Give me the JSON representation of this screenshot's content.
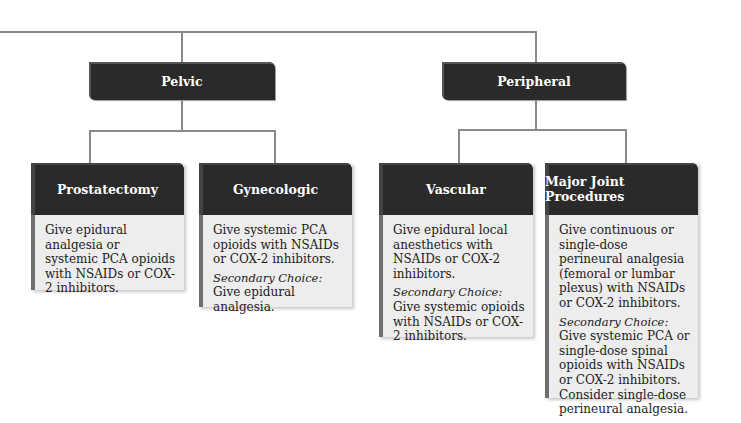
{
  "categories": [
    {
      "label": "Pelvic"
    },
    {
      "label": "Peripheral"
    }
  ],
  "procedures": [
    {
      "title": "Prostatectomy",
      "text": "Give epidural analgesia or systemic PCA opioids with NSAIDs or COX-2 inhibitors.",
      "secondary_label": "",
      "secondary_text": ""
    },
    {
      "title": "Gynecologic",
      "text": "Give systemic PCA opioids with NSAIDs or COX-2 inhibitors.",
      "secondary_label": "Secondary Choice:",
      "secondary_text": "Give epidural analgesia."
    },
    {
      "title": "Vascular",
      "text": "Give epidural local anesthetics with NSAIDs or COX-2 inhibitors.",
      "secondary_label": "Secondary Choice:",
      "secondary_text": "Give systemic opioids with NSAIDs or COX-2 inhibitors."
    },
    {
      "title": "Major Joint Procedures",
      "text": "Give continuous or single-dose perineural analgesia (femoral or lumbar plexus) with NSAIDs or COX-2 inhibitors.",
      "secondary_label": "Secondary Choice:",
      "secondary_text": "Give systemic PCA or single-dose spinal opioids with NSAIDs or COX-2 inhibitors. Consider single-dose perineural analgesia."
    }
  ]
}
